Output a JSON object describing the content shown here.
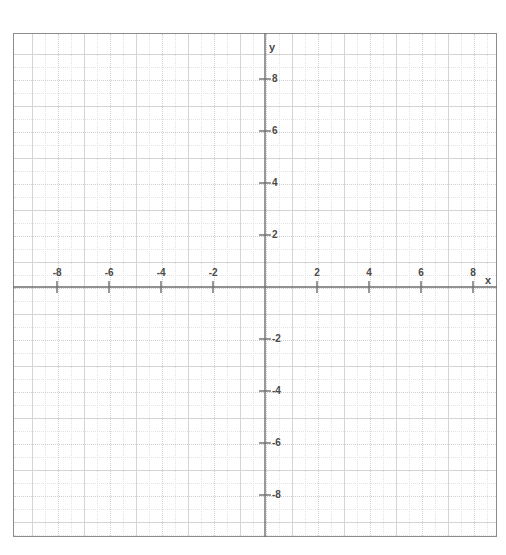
{
  "chart_data": {
    "type": "line",
    "title": "",
    "subtitle": "",
    "xlabel": "x",
    "ylabel": "y",
    "xlim": [
      -9.25,
      8.9
    ],
    "ylim": [
      -9.55,
      9.25
    ],
    "grid": true,
    "minor_grid": true,
    "major_grid_step": 1,
    "minor_grid_step": 0.5,
    "tick_step": 2,
    "legend": "none",
    "series": [],
    "x_tick_labels": [
      "-8",
      "-6",
      "-4",
      "-2",
      "2",
      "4",
      "6",
      "8"
    ],
    "x_tick_values": [
      -8,
      -6,
      -4,
      -2,
      2,
      4,
      6,
      8
    ],
    "y_tick_labels": [
      "8",
      "6",
      "4",
      "2",
      "-2",
      "-4",
      "-6",
      "-8"
    ],
    "y_tick_values": [
      8,
      6,
      4,
      2,
      -2,
      -4,
      -6,
      -8
    ],
    "annotations": []
  },
  "axes": {
    "x_axis_name": "x",
    "y_axis_name": "y"
  },
  "colors": {
    "border": "#8c8c8c",
    "axis_line": "#6e6e6e",
    "major_grid": "#d4d4d4",
    "minor_grid": "#e3e3e3",
    "dotted_grid": "#cfcfcf",
    "tick_text": "#4a4a4a",
    "background": "#ffffff"
  }
}
